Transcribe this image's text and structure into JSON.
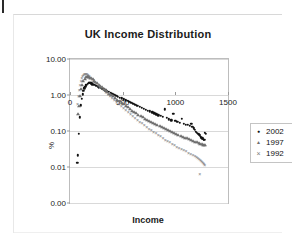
{
  "page": {
    "mark": "scan-edge-mark"
  },
  "chart_data": {
    "type": "scatter",
    "title": "UK Income Distribution",
    "xlabel": "Income",
    "ylabel": "%",
    "xlim": [
      0,
      1500
    ],
    "xticks": [
      0,
      500,
      1000,
      1500
    ],
    "xticklabels": [
      "0",
      "500",
      "1000",
      "1500"
    ],
    "ylim": [
      0.001,
      10.0
    ],
    "yscale": "log",
    "yticks": [
      10.0,
      1.0,
      0.1,
      0.01,
      0.001
    ],
    "yticklabels": [
      "10.00",
      "1.00",
      "0.10",
      "0.01",
      "0.00"
    ],
    "grid": true,
    "legend_position": "right",
    "axis_crosses_y_at": 1.0,
    "series": [
      {
        "name": "2002",
        "marker": "filled-circle",
        "color": "#111111",
        "points": [
          [
            70,
            0.013
          ],
          [
            75,
            0.021
          ],
          [
            82,
            0.085
          ],
          [
            95,
            0.24
          ],
          [
            104,
            0.52
          ],
          [
            112,
            0.78
          ],
          [
            120,
            1.05
          ],
          [
            128,
            1.32
          ],
          [
            136,
            1.55
          ],
          [
            145,
            1.7
          ],
          [
            152,
            1.85
          ],
          [
            160,
            1.95
          ],
          [
            168,
            2.05
          ],
          [
            176,
            2.15
          ],
          [
            185,
            2.2
          ],
          [
            193,
            2.18
          ],
          [
            202,
            2.1
          ],
          [
            212,
            2.0
          ],
          [
            224,
            1.95
          ],
          [
            236,
            1.9
          ],
          [
            248,
            1.8
          ],
          [
            262,
            1.72
          ],
          [
            276,
            1.65
          ],
          [
            290,
            1.58
          ],
          [
            305,
            1.5
          ],
          [
            320,
            1.44
          ],
          [
            336,
            1.36
          ],
          [
            352,
            1.28
          ],
          [
            368,
            1.22
          ],
          [
            385,
            1.15
          ],
          [
            402,
            1.08
          ],
          [
            420,
            1.02
          ],
          [
            438,
            0.96
          ],
          [
            456,
            0.9
          ],
          [
            474,
            0.85
          ],
          [
            492,
            0.8
          ],
          [
            510,
            0.76
          ],
          [
            528,
            0.72
          ],
          [
            546,
            0.68
          ],
          [
            564,
            0.64
          ],
          [
            582,
            0.6
          ],
          [
            600,
            0.57
          ],
          [
            620,
            0.54
          ],
          [
            640,
            0.5
          ],
          [
            660,
            0.47
          ],
          [
            680,
            0.44
          ],
          [
            700,
            0.42
          ],
          [
            720,
            0.39
          ],
          [
            740,
            0.37
          ],
          [
            760,
            0.35
          ],
          [
            780,
            0.33
          ],
          [
            800,
            0.31
          ],
          [
            820,
            0.29
          ],
          [
            840,
            0.27
          ],
          [
            860,
            0.26
          ],
          [
            880,
            0.25
          ],
          [
            900,
            0.4
          ],
          [
            920,
            0.23
          ],
          [
            940,
            0.21
          ],
          [
            960,
            0.2
          ],
          [
            980,
            0.3
          ],
          [
            1000,
            0.19
          ],
          [
            1020,
            0.18
          ],
          [
            1040,
            0.17
          ],
          [
            1060,
            0.22
          ],
          [
            1080,
            0.16
          ],
          [
            1100,
            0.15
          ],
          [
            1120,
            0.15
          ],
          [
            1140,
            0.14
          ],
          [
            1150,
            0.16
          ],
          [
            1160,
            0.13
          ],
          [
            1175,
            0.12
          ],
          [
            1185,
            0.11
          ],
          [
            1195,
            0.095
          ],
          [
            1205,
            0.09
          ],
          [
            1215,
            0.085
          ],
          [
            1220,
            0.08
          ],
          [
            1230,
            0.075
          ],
          [
            1240,
            0.07
          ],
          [
            1248,
            0.065
          ],
          [
            1255,
            0.062
          ],
          [
            1262,
            0.06
          ],
          [
            1268,
            0.058
          ],
          [
            1275,
            0.056
          ],
          [
            1282,
            0.09
          ],
          [
            1288,
            0.085
          ]
        ]
      },
      {
        "name": "1997",
        "marker": "triangle",
        "color": "#6e6e6e",
        "points": [
          [
            78,
            0.3
          ],
          [
            88,
            0.5
          ],
          [
            98,
            0.95
          ],
          [
            108,
            1.45
          ],
          [
            118,
            1.9
          ],
          [
            128,
            2.4
          ],
          [
            138,
            2.8
          ],
          [
            148,
            3.1
          ],
          [
            158,
            3.25
          ],
          [
            168,
            3.3
          ],
          [
            178,
            3.2
          ],
          [
            190,
            3.05
          ],
          [
            202,
            2.9
          ],
          [
            215,
            2.7
          ],
          [
            228,
            2.5
          ],
          [
            242,
            2.3
          ],
          [
            256,
            2.12
          ],
          [
            272,
            1.95
          ],
          [
            288,
            1.78
          ],
          [
            304,
            1.62
          ],
          [
            320,
            1.48
          ],
          [
            338,
            1.34
          ],
          [
            356,
            1.22
          ],
          [
            374,
            1.1
          ],
          [
            392,
            1.0
          ],
          [
            410,
            0.91
          ],
          [
            430,
            0.82
          ],
          [
            450,
            0.74
          ],
          [
            470,
            0.67
          ],
          [
            490,
            0.61
          ],
          [
            510,
            0.55
          ],
          [
            530,
            0.5
          ],
          [
            550,
            0.45
          ],
          [
            570,
            0.41
          ],
          [
            590,
            0.37
          ],
          [
            610,
            0.34
          ],
          [
            630,
            0.31
          ],
          [
            650,
            0.285
          ],
          [
            670,
            0.26
          ],
          [
            690,
            0.24
          ],
          [
            710,
            0.22
          ],
          [
            730,
            0.205
          ],
          [
            750,
            0.19
          ],
          [
            770,
            0.175
          ],
          [
            790,
            0.165
          ],
          [
            810,
            0.155
          ],
          [
            830,
            0.145
          ],
          [
            850,
            0.135
          ],
          [
            870,
            0.128
          ],
          [
            890,
            0.12
          ],
          [
            910,
            0.112
          ],
          [
            930,
            0.105
          ],
          [
            950,
            0.098
          ],
          [
            970,
            0.092
          ],
          [
            990,
            0.087
          ],
          [
            1010,
            0.082
          ],
          [
            1030,
            0.077
          ],
          [
            1050,
            0.073
          ],
          [
            1070,
            0.069
          ],
          [
            1090,
            0.065
          ],
          [
            1110,
            0.062
          ],
          [
            1130,
            0.059
          ],
          [
            1150,
            0.056
          ],
          [
            1170,
            0.053
          ],
          [
            1190,
            0.05
          ],
          [
            1205,
            0.048
          ],
          [
            1220,
            0.046
          ],
          [
            1235,
            0.044
          ],
          [
            1250,
            0.043
          ],
          [
            1262,
            0.042
          ],
          [
            1275,
            0.041
          ],
          [
            1285,
            0.04
          ]
        ]
      },
      {
        "name": "1992",
        "marker": "x",
        "color": "#7a7a7a",
        "points": [
          [
            72,
            0.55
          ],
          [
            80,
            0.95
          ],
          [
            88,
            1.4
          ],
          [
            96,
            1.95
          ],
          [
            104,
            2.45
          ],
          [
            112,
            2.95
          ],
          [
            120,
            3.35
          ],
          [
            128,
            3.65
          ],
          [
            136,
            3.85
          ],
          [
            144,
            3.95
          ],
          [
            152,
            3.9
          ],
          [
            162,
            3.75
          ],
          [
            172,
            3.55
          ],
          [
            184,
            3.3
          ],
          [
            196,
            3.05
          ],
          [
            210,
            2.8
          ],
          [
            224,
            2.55
          ],
          [
            238,
            2.32
          ],
          [
            254,
            2.1
          ],
          [
            270,
            1.9
          ],
          [
            286,
            1.7
          ],
          [
            304,
            1.52
          ],
          [
            322,
            1.36
          ],
          [
            340,
            1.2
          ],
          [
            360,
            1.06
          ],
          [
            380,
            0.94
          ],
          [
            400,
            0.83
          ],
          [
            420,
            0.73
          ],
          [
            442,
            0.64
          ],
          [
            464,
            0.56
          ],
          [
            486,
            0.49
          ],
          [
            508,
            0.43
          ],
          [
            530,
            0.38
          ],
          [
            552,
            0.335
          ],
          [
            574,
            0.295
          ],
          [
            596,
            0.26
          ],
          [
            618,
            0.23
          ],
          [
            640,
            0.205
          ],
          [
            662,
            0.182
          ],
          [
            684,
            0.162
          ],
          [
            706,
            0.145
          ],
          [
            728,
            0.13
          ],
          [
            750,
            0.117
          ],
          [
            772,
            0.105
          ],
          [
            794,
            0.095
          ],
          [
            816,
            0.086
          ],
          [
            838,
            0.078
          ],
          [
            860,
            0.071
          ],
          [
            882,
            0.064
          ],
          [
            904,
            0.058
          ],
          [
            926,
            0.053
          ],
          [
            948,
            0.048
          ],
          [
            970,
            0.044
          ],
          [
            992,
            0.04
          ],
          [
            1014,
            0.037
          ],
          [
            1036,
            0.034
          ],
          [
            1058,
            0.031
          ],
          [
            1080,
            0.029
          ],
          [
            1102,
            0.027
          ],
          [
            1124,
            0.025
          ],
          [
            1146,
            0.023
          ],
          [
            1168,
            0.021
          ],
          [
            1186,
            0.02
          ],
          [
            1200,
            0.019
          ],
          [
            1212,
            0.018
          ],
          [
            1224,
            0.017
          ],
          [
            1236,
            0.016
          ],
          [
            1246,
            0.015
          ],
          [
            1256,
            0.014
          ],
          [
            1264,
            0.013
          ],
          [
            1272,
            0.012
          ],
          [
            1280,
            0.0115
          ],
          [
            1232,
            0.0065
          ]
        ]
      }
    ]
  }
}
